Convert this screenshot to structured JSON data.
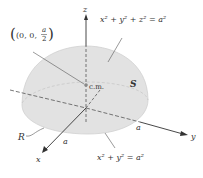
{
  "diagram": {
    "type": "hemisphere-center-of-mass",
    "axes": {
      "x": "x",
      "y": "y",
      "z": "z"
    },
    "labels": {
      "point_prefix": "(0, 0,",
      "point_num": "a",
      "point_den": "2",
      "point_suffix": ")",
      "sphere_eq": "x² + y² + z² = a²",
      "circle_eq": "x² + y² = a²",
      "surface": "S",
      "region": "R",
      "cm": "c.m.",
      "radius_x": "a",
      "radius_y": "a"
    },
    "colors": {
      "hemisphere_fill": "#e2e2e2",
      "hemisphere_edge": "#cfcfcf",
      "axis": "#333333",
      "text": "#333333"
    }
  }
}
